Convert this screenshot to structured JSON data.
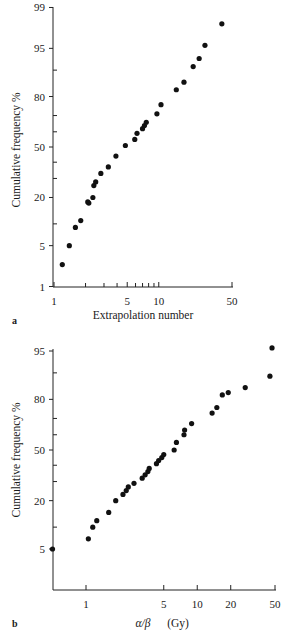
{
  "chart_data": [
    {
      "type": "scatter",
      "panel_label": "a",
      "title": "",
      "xlabel": "Extrapolation number",
      "ylabel": "Cumulative frequency %",
      "x_scale": "log",
      "y_scale": "probability",
      "xlim": [
        1,
        50
      ],
      "ylim": [
        1,
        99
      ],
      "x_ticks": [
        1,
        5,
        10,
        50
      ],
      "x_minor_ticks": [
        2,
        3,
        4,
        6,
        7,
        8,
        9
      ],
      "y_ticks": [
        1,
        5,
        20,
        50,
        80,
        95,
        99
      ],
      "y_minor_ticks": [
        10,
        30,
        40,
        60,
        70,
        90
      ],
      "grid": false,
      "legend": null,
      "points": [
        {
          "x": 1.2,
          "y": 2.5
        },
        {
          "x": 1.4,
          "y": 5
        },
        {
          "x": 1.6,
          "y": 9
        },
        {
          "x": 1.8,
          "y": 11
        },
        {
          "x": 2.1,
          "y": 18
        },
        {
          "x": 2.15,
          "y": 17.5
        },
        {
          "x": 2.35,
          "y": 20
        },
        {
          "x": 2.4,
          "y": 26
        },
        {
          "x": 2.5,
          "y": 28
        },
        {
          "x": 2.8,
          "y": 33
        },
        {
          "x": 3.3,
          "y": 37
        },
        {
          "x": 3.9,
          "y": 44
        },
        {
          "x": 4.8,
          "y": 51
        },
        {
          "x": 5.9,
          "y": 55
        },
        {
          "x": 6.2,
          "y": 59
        },
        {
          "x": 7.0,
          "y": 62
        },
        {
          "x": 7.3,
          "y": 64
        },
        {
          "x": 7.6,
          "y": 66
        },
        {
          "x": 9.6,
          "y": 71
        },
        {
          "x": 10.5,
          "y": 76
        },
        {
          "x": 14.7,
          "y": 83
        },
        {
          "x": 17.4,
          "y": 86
        },
        {
          "x": 21.3,
          "y": 91
        },
        {
          "x": 24.3,
          "y": 93
        },
        {
          "x": 27.6,
          "y": 95.5
        },
        {
          "x": 40,
          "y": 98
        }
      ],
      "marker_color": "#111111"
    },
    {
      "type": "scatter",
      "panel_label": "b",
      "title": "",
      "xlabel": "α/β",
      "xlabel_unit": "(Gy)",
      "ylabel": "Cumulative frequency %",
      "x_scale": "log",
      "y_scale": "probability",
      "xlim": [
        0.5,
        50
      ],
      "ylim": [
        1,
        96
      ],
      "x_ticks": [
        1,
        5,
        10,
        20,
        50
      ],
      "y_ticks": [
        5,
        20,
        50,
        80,
        95
      ],
      "y_minor_ticks": [
        10,
        30,
        40,
        60,
        70,
        90
      ],
      "grid": false,
      "legend": null,
      "points": [
        {
          "x": 0.5,
          "y": 5
        },
        {
          "x": 1.05,
          "y": 7
        },
        {
          "x": 1.15,
          "y": 10
        },
        {
          "x": 1.25,
          "y": 12
        },
        {
          "x": 1.6,
          "y": 15
        },
        {
          "x": 1.85,
          "y": 20
        },
        {
          "x": 2.15,
          "y": 23
        },
        {
          "x": 2.3,
          "y": 25
        },
        {
          "x": 2.4,
          "y": 27
        },
        {
          "x": 2.7,
          "y": 29
        },
        {
          "x": 3.2,
          "y": 32
        },
        {
          "x": 3.4,
          "y": 34
        },
        {
          "x": 3.6,
          "y": 36
        },
        {
          "x": 3.7,
          "y": 38
        },
        {
          "x": 4.3,
          "y": 41
        },
        {
          "x": 4.5,
          "y": 43
        },
        {
          "x": 4.8,
          "y": 45
        },
        {
          "x": 5.0,
          "y": 47
        },
        {
          "x": 6.2,
          "y": 50
        },
        {
          "x": 6.5,
          "y": 55
        },
        {
          "x": 7.6,
          "y": 60
        },
        {
          "x": 7.7,
          "y": 63
        },
        {
          "x": 8.9,
          "y": 67
        },
        {
          "x": 13.6,
          "y": 73
        },
        {
          "x": 15,
          "y": 76
        },
        {
          "x": 16.8,
          "y": 82
        },
        {
          "x": 19.0,
          "y": 83
        },
        {
          "x": 27,
          "y": 85
        },
        {
          "x": 45,
          "y": 89
        },
        {
          "x": 47,
          "y": 95.5
        }
      ],
      "marker_color": "#111111"
    }
  ]
}
